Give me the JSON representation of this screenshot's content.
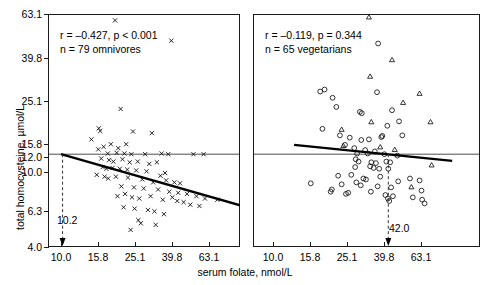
{
  "figure": {
    "x_axis_title": "serum folate, nmol/L",
    "y_axis_title": "total homocysteine, µmol/L"
  },
  "chart_data": {
    "type": "scatter",
    "title": "",
    "xlabel": "serum folate, nmol/L",
    "ylabel": "total homocysteine, µmol/L",
    "x_scale": "log",
    "y_scale": "log",
    "xlim": [
      8.0,
      93.0
    ],
    "ylim": [
      4.0,
      63.1
    ],
    "xticks": [
      10.0,
      15.8,
      25.1,
      39.8,
      63.1
    ],
    "xtick_labels": [
      "10.0",
      "15.8",
      "25.1",
      "39.8",
      "63.1"
    ],
    "yticks": [
      4.0,
      6.3,
      10.0,
      12.0,
      15.8,
      25.1,
      39.8,
      63.1
    ],
    "ytick_labels": [
      "4.0",
      "6.3",
      "10.0",
      "12.0",
      "15.8",
      "25.1",
      "39.8",
      "63.1"
    ],
    "grid": false,
    "legend": "none",
    "reference_line_y": 12.0,
    "panels": [
      {
        "id": "omnivores",
        "annotation_line1": "r = –0.427, p < 0.001",
        "annotation_line2": "n = 79 omnivores",
        "r": -0.427,
        "p_text": "< 0.001",
        "n": 79,
        "group": "omnivores",
        "cutoff_label": "10.2",
        "cutoff_value": 10.2,
        "regression": {
          "x1": 10.0,
          "y1": 12.0,
          "x2": 93.0,
          "y2": 6.55
        },
        "series": [
          {
            "name": "omnivores",
            "marker": "x",
            "points": [
              [
                19.6,
                58.5
              ],
              [
                39.5,
                46.0
              ],
              [
                21.0,
                20.5
              ],
              [
                16.3,
                15.8
              ],
              [
                24.5,
                15.7
              ],
              [
                31.0,
                15.4
              ],
              [
                14.6,
                14.3
              ],
              [
                16.0,
                16.3
              ],
              [
                22.5,
                13.5
              ],
              [
                17.0,
                13.1
              ],
              [
                18.6,
                13.5
              ],
              [
                20.4,
                12.9
              ],
              [
                15.9,
                12.7
              ],
              [
                17.9,
                12.1
              ],
              [
                20.0,
                12.2
              ],
              [
                22.0,
                12.1
              ],
              [
                24.0,
                12.0
              ],
              [
                28.5,
                12.0
              ],
              [
                35.0,
                12.1
              ],
              [
                38.0,
                12.0
              ],
              [
                52.0,
                12.0
              ],
              [
                59.0,
                12.0
              ],
              [
                16.5,
                11.4
              ],
              [
                18.2,
                11.2
              ],
              [
                19.2,
                11.0
              ],
              [
                21.5,
                11.3
              ],
              [
                23.5,
                10.9
              ],
              [
                26.0,
                11.0
              ],
              [
                30.0,
                10.7
              ],
              [
                33.0,
                10.9
              ],
              [
                16.8,
                10.3
              ],
              [
                17.6,
                10.1
              ],
              [
                19.0,
                10.2
              ],
              [
                20.8,
                10.1
              ],
              [
                22.8,
                10.0
              ],
              [
                25.5,
                9.9
              ],
              [
                29.0,
                9.8
              ],
              [
                34.5,
                9.3
              ],
              [
                36.5,
                9.6
              ],
              [
                15.6,
                9.4
              ],
              [
                17.2,
                9.2
              ],
              [
                18.0,
                9.0
              ],
              [
                19.8,
                9.2
              ],
              [
                23.0,
                9.1
              ],
              [
                27.5,
                8.9
              ],
              [
                31.5,
                8.6
              ],
              [
                37.0,
                8.8
              ],
              [
                41.0,
                8.6
              ],
              [
                44.0,
                8.5
              ],
              [
                21.2,
                8.2
              ],
              [
                24.8,
                8.1
              ],
              [
                28.0,
                8.0
              ],
              [
                33.5,
                7.9
              ],
              [
                38.5,
                7.7
              ],
              [
                43.0,
                7.6
              ],
              [
                48.0,
                7.5
              ],
              [
                54.0,
                7.3
              ],
              [
                60.0,
                7.1
              ],
              [
                70.0,
                7.0
              ],
              [
                20.2,
                7.3
              ],
              [
                22.2,
                7.5
              ],
              [
                24.2,
                7.2
              ],
              [
                26.5,
                7.1
              ],
              [
                30.5,
                7.3
              ],
              [
                35.5,
                7.0
              ],
              [
                40.0,
                7.2
              ],
              [
                42.5,
                6.9
              ],
              [
                46.0,
                6.8
              ],
              [
                50.0,
                6.6
              ],
              [
                56.0,
                6.5
              ],
              [
                21.8,
                6.4
              ],
              [
                25.0,
                6.3
              ],
              [
                29.5,
                6.2
              ],
              [
                32.0,
                6.1
              ],
              [
                36.0,
                5.9
              ],
              [
                27.0,
                5.3
              ],
              [
                32.5,
                5.2
              ],
              [
                23.8,
                4.9
              ],
              [
                26.2,
                5.5
              ]
            ]
          }
        ]
      },
      {
        "id": "vegetarians",
        "annotation_line1": "r = –0.119, p = 0.344",
        "annotation_line2": "n = 65 vegetarians",
        "r": -0.119,
        "p_text": "0.344",
        "n": 65,
        "group": "vegetarians",
        "cutoff_label": "42.0",
        "cutoff_value": 42.0,
        "regression": {
          "x1": 13.0,
          "y1": 13.4,
          "x2": 93.0,
          "y2": 11.1
        },
        "series": [
          {
            "name": "vegetarians-circles",
            "marker": "circle",
            "points": [
              [
                37.0,
                44.5
              ],
              [
                19.0,
                25.8
              ],
              [
                18.0,
                25.2
              ],
              [
                36.5,
                25.0
              ],
              [
                21.0,
                23.4
              ],
              [
                22.0,
                21.0
              ],
              [
                29.5,
                19.8
              ],
              [
                30.2,
                19.5
              ],
              [
                44.0,
                20.2
              ],
              [
                48.0,
                17.7
              ],
              [
                18.5,
                16.2
              ],
              [
                41.5,
                16.8
              ],
              [
                23.0,
                15.0
              ],
              [
                50.0,
                15.0
              ],
              [
                26.0,
                14.6
              ],
              [
                30.0,
                14.2
              ],
              [
                33.0,
                14.3
              ],
              [
                38.5,
                14.7
              ],
              [
                39.0,
                14.9
              ],
              [
                24.5,
                13.4
              ],
              [
                27.5,
                12.9
              ],
              [
                31.5,
                12.6
              ],
              [
                35.5,
                12.4
              ],
              [
                28.5,
                12.1
              ],
              [
                32.5,
                12.1
              ],
              [
                40.0,
                12.0
              ],
              [
                47.0,
                11.8
              ],
              [
                28.0,
                11.3
              ],
              [
                29.0,
                11.0
              ],
              [
                34.0,
                10.9
              ],
              [
                36.0,
                10.8
              ],
              [
                41.0,
                11.0
              ],
              [
                43.0,
                10.9
              ],
              [
                27.8,
                10.3
              ],
              [
                33.5,
                10.4
              ],
              [
                35.0,
                10.2
              ],
              [
                37.5,
                10.1
              ],
              [
                42.0,
                10.1
              ],
              [
                22.5,
                9.3
              ],
              [
                26.5,
                9.4
              ],
              [
                30.8,
                9.0
              ],
              [
                31.8,
                8.9
              ],
              [
                38.0,
                9.2
              ],
              [
                47.5,
                8.7
              ],
              [
                55.0,
                9.0
              ],
              [
                62.0,
                8.8
              ],
              [
                16.0,
                8.5
              ],
              [
                23.5,
                8.4
              ],
              [
                28.2,
                8.6
              ],
              [
                29.8,
                8.3
              ],
              [
                36.8,
                8.2
              ],
              [
                43.5,
                8.1
              ],
              [
                20.5,
                7.7
              ],
              [
                24.8,
                7.5
              ],
              [
                25.5,
                7.6
              ],
              [
                33.8,
                7.7
              ],
              [
                40.5,
                7.4
              ],
              [
                63.5,
                7.8
              ],
              [
                42.5,
                6.9
              ],
              [
                41.8,
                7.1
              ],
              [
                64.0,
                7.0
              ],
              [
                66.0,
                6.7
              ],
              [
                44.5,
                7.3
              ],
              [
                57.0,
                7.2
              ],
              [
                20.8,
                7.9
              ]
            ]
          },
          {
            "name": "vegetarians-triangles",
            "marker": "triangle",
            "points": [
              [
                33.0,
                60.5
              ],
              [
                44.0,
                36.5
              ],
              [
                62.0,
                24.5
              ],
              [
                50.5,
                22.0
              ],
              [
                34.0,
                17.5
              ],
              [
                23.5,
                16.0
              ],
              [
                33.5,
                30.0
              ],
              [
                38.0,
                13.0
              ],
              [
                45.5,
                12.6
              ],
              [
                24.0,
                13.2
              ],
              [
                56.0,
                8.1
              ],
              [
                71.0,
                17.5
              ],
              [
                72.0,
                10.5
              ]
            ]
          }
        ]
      }
    ]
  }
}
